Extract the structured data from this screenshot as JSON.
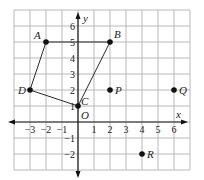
{
  "diagram": {
    "type": "coordinate-plane",
    "axes": {
      "x_label": "x",
      "y_label": "y",
      "origin_label": "O"
    },
    "x_range": [
      -4,
      7
    ],
    "y_range": [
      -3,
      7
    ],
    "x_ticks": [
      {
        "v": -3,
        "label": "−3"
      },
      {
        "v": -2,
        "label": "−2"
      },
      {
        "v": -1,
        "label": "−1"
      },
      {
        "v": 1,
        "label": "1"
      },
      {
        "v": 2,
        "label": "2"
      },
      {
        "v": 3,
        "label": "3"
      },
      {
        "v": 4,
        "label": "4"
      },
      {
        "v": 5,
        "label": "5"
      },
      {
        "v": 6,
        "label": "6"
      }
    ],
    "y_ticks": [
      {
        "v": 6,
        "label": "6"
      },
      {
        "v": 5,
        "label": "5"
      },
      {
        "v": 4,
        "label": "4"
      },
      {
        "v": 3,
        "label": "3"
      },
      {
        "v": 2,
        "label": "2"
      },
      {
        "v": 1,
        "label": "1"
      },
      {
        "v": -1,
        "label": "−1"
      },
      {
        "v": -2,
        "label": "−2"
      }
    ],
    "points": [
      {
        "name": "A",
        "x": -2,
        "y": 5,
        "dx": -12,
        "dy": -3
      },
      {
        "name": "B",
        "x": 2,
        "y": 5,
        "dx": 4,
        "dy": -4
      },
      {
        "name": "C",
        "x": 0,
        "y": 1,
        "dx": 3,
        "dy": -1
      },
      {
        "name": "D",
        "x": -3,
        "y": 2,
        "dx": -12,
        "dy": 4
      },
      {
        "name": "P",
        "x": 2,
        "y": 2,
        "dx": 5,
        "dy": 4
      },
      {
        "name": "Q",
        "x": 6,
        "y": 2,
        "dx": 5,
        "dy": 4
      },
      {
        "name": "R",
        "x": 4,
        "y": -2,
        "dx": 5,
        "dy": 4
      }
    ],
    "polygon": [
      "A",
      "B",
      "C",
      "D"
    ]
  }
}
